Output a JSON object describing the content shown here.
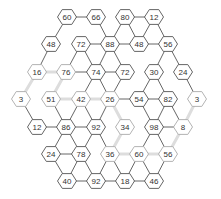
{
  "puzzle": {
    "type": "hexagonal-number-grid",
    "colors": {
      "line": "#555555",
      "highlight_path": "#dddddd",
      "hex_fill": "#ffffff",
      "hex_stroke": "#555555",
      "faded_text": "#999999",
      "text": "#333333"
    },
    "nodes": [
      {
        "id": "n0",
        "value": "60",
        "x": 67,
        "y": 17,
        "faded": false
      },
      {
        "id": "n1",
        "value": "66",
        "x": 96,
        "y": 17,
        "faded": false
      },
      {
        "id": "n2",
        "value": "80",
        "x": 125,
        "y": 17,
        "faded": false
      },
      {
        "id": "n3",
        "value": "12",
        "x": 154,
        "y": 17,
        "faded": false
      },
      {
        "id": "n4",
        "value": "48",
        "x": 51,
        "y": 44,
        "faded": false
      },
      {
        "id": "n5",
        "value": "72",
        "x": 81,
        "y": 44,
        "faded": false
      },
      {
        "id": "n6",
        "value": "88",
        "x": 110,
        "y": 44,
        "faded": false
      },
      {
        "id": "n7",
        "value": "48",
        "x": 139,
        "y": 44,
        "faded": false
      },
      {
        "id": "n8",
        "value": "56",
        "x": 168,
        "y": 44,
        "faded": false
      },
      {
        "id": "n9",
        "value": "16",
        "x": 37,
        "y": 72,
        "faded": true
      },
      {
        "id": "n10",
        "value": "76",
        "x": 66,
        "y": 72,
        "faded": true
      },
      {
        "id": "n11",
        "value": "74",
        "x": 96,
        "y": 72,
        "faded": false
      },
      {
        "id": "n12",
        "value": "72",
        "x": 125,
        "y": 72,
        "faded": false
      },
      {
        "id": "n13",
        "value": "30",
        "x": 154,
        "y": 72,
        "faded": false
      },
      {
        "id": "n14",
        "value": "24",
        "x": 183,
        "y": 72,
        "faded": false
      },
      {
        "id": "n15",
        "value": "3",
        "x": 21,
        "y": 99,
        "faded": true
      },
      {
        "id": "n16",
        "value": "51",
        "x": 51,
        "y": 99,
        "faded": true
      },
      {
        "id": "n17",
        "value": "42",
        "x": 81,
        "y": 99,
        "faded": true
      },
      {
        "id": "n18",
        "value": "26",
        "x": 110,
        "y": 99,
        "faded": true
      },
      {
        "id": "n19",
        "value": "54",
        "x": 139,
        "y": 99,
        "faded": false
      },
      {
        "id": "n20",
        "value": "82",
        "x": 168,
        "y": 99,
        "faded": false
      },
      {
        "id": "n21",
        "value": "3",
        "x": 197,
        "y": 99,
        "faded": true
      },
      {
        "id": "n22",
        "value": "12",
        "x": 37,
        "y": 127,
        "faded": false
      },
      {
        "id": "n23",
        "value": "86",
        "x": 66,
        "y": 127,
        "faded": false
      },
      {
        "id": "n24",
        "value": "92",
        "x": 96,
        "y": 127,
        "faded": false
      },
      {
        "id": "n25",
        "value": "34",
        "x": 125,
        "y": 127,
        "faded": true
      },
      {
        "id": "n26",
        "value": "98",
        "x": 154,
        "y": 127,
        "faded": false
      },
      {
        "id": "n27",
        "value": "8",
        "x": 183,
        "y": 127,
        "faded": true
      },
      {
        "id": "n28",
        "value": "24",
        "x": 51,
        "y": 154,
        "faded": false
      },
      {
        "id": "n29",
        "value": "78",
        "x": 81,
        "y": 154,
        "faded": false
      },
      {
        "id": "n30",
        "value": "36",
        "x": 110,
        "y": 154,
        "faded": true
      },
      {
        "id": "n31",
        "value": "60",
        "x": 139,
        "y": 154,
        "faded": true
      },
      {
        "id": "n32",
        "value": "56",
        "x": 168,
        "y": 154,
        "faded": true
      },
      {
        "id": "n33",
        "value": "40",
        "x": 67,
        "y": 181,
        "faded": false
      },
      {
        "id": "n34",
        "value": "92",
        "x": 96,
        "y": 181,
        "faded": false
      },
      {
        "id": "n35",
        "value": "18",
        "x": 125,
        "y": 181,
        "faded": false
      },
      {
        "id": "n36",
        "value": "46",
        "x": 154,
        "y": 181,
        "faded": false
      }
    ],
    "edges": [
      [
        "n0",
        "n1"
      ],
      [
        "n2",
        "n3"
      ],
      [
        "n0",
        "n4"
      ],
      [
        "n1",
        "n6"
      ],
      [
        "n2",
        "n6"
      ],
      [
        "n2",
        "n7"
      ],
      [
        "n3",
        "n7"
      ],
      [
        "n3",
        "n8"
      ],
      [
        "n5",
        "n6"
      ],
      [
        "n6",
        "n7"
      ],
      [
        "n7",
        "n8"
      ],
      [
        "n4",
        "n9"
      ],
      [
        "n5",
        "n10"
      ],
      [
        "n5",
        "n11"
      ],
      [
        "n6",
        "n11"
      ],
      [
        "n6",
        "n12"
      ],
      [
        "n8",
        "n13"
      ],
      [
        "n8",
        "n14"
      ],
      [
        "n10",
        "n11"
      ],
      [
        "n11",
        "n12"
      ],
      [
        "n9",
        "n15"
      ],
      [
        "n10",
        "n16"
      ],
      [
        "n11",
        "n17"
      ],
      [
        "n11",
        "n18"
      ],
      [
        "n12",
        "n18"
      ],
      [
        "n13",
        "n19"
      ],
      [
        "n13",
        "n20"
      ],
      [
        "n14",
        "n21"
      ],
      [
        "n18",
        "n19"
      ],
      [
        "n19",
        "n20"
      ],
      [
        "n15",
        "n22"
      ],
      [
        "n16",
        "n23"
      ],
      [
        "n17",
        "n23"
      ],
      [
        "n17",
        "n24"
      ],
      [
        "n18",
        "n24"
      ],
      [
        "n19",
        "n26"
      ],
      [
        "n20",
        "n26"
      ],
      [
        "n20",
        "n27"
      ],
      [
        "n22",
        "n23"
      ],
      [
        "n23",
        "n24"
      ],
      [
        "n26",
        "n27"
      ],
      [
        "n23",
        "n28"
      ],
      [
        "n23",
        "n29"
      ],
      [
        "n24",
        "n29"
      ],
      [
        "n24",
        "n30"
      ],
      [
        "n25",
        "n30"
      ],
      [
        "n26",
        "n31"
      ],
      [
        "n26",
        "n32"
      ],
      [
        "n28",
        "n29"
      ],
      [
        "n28",
        "n33"
      ],
      [
        "n29",
        "n33"
      ],
      [
        "n29",
        "n34"
      ],
      [
        "n30",
        "n34"
      ],
      [
        "n30",
        "n35"
      ],
      [
        "n31",
        "n35"
      ],
      [
        "n31",
        "n36"
      ],
      [
        "n32",
        "n36"
      ],
      [
        "n33",
        "n34"
      ],
      [
        "n34",
        "n35"
      ],
      [
        "n35",
        "n36"
      ]
    ],
    "highlight_path": [
      [
        "n15",
        "n9"
      ],
      [
        "n9",
        "n10"
      ],
      [
        "n10",
        "n16"
      ],
      [
        "n16",
        "n17"
      ],
      [
        "n17",
        "n18"
      ],
      [
        "n18",
        "n25"
      ],
      [
        "n25",
        "n30"
      ],
      [
        "n30",
        "n31"
      ],
      [
        "n31",
        "n32"
      ],
      [
        "n32",
        "n27"
      ],
      [
        "n27",
        "n21"
      ]
    ]
  }
}
